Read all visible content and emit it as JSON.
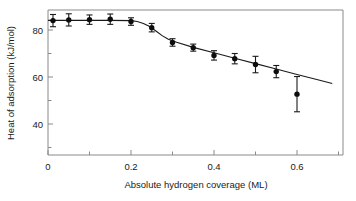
{
  "chart_data": {
    "type": "scatter",
    "title": "",
    "xlabel": "Absolute hydrogen coverage (ML)",
    "ylabel": "Heat of adsorption (kJ/mol)",
    "xlim": [
      0,
      0.71
    ],
    "ylim": [
      31,
      89
    ],
    "grid": false,
    "legend": null,
    "x_ticks": [
      0,
      0.2,
      0.4,
      0.6
    ],
    "x_tick_labels": [
      "0",
      "0.2",
      "0.4",
      "0.6"
    ],
    "x_minor_ticks": [
      0.1,
      0.3,
      0.5,
      0.7
    ],
    "y_ticks": [
      40,
      60,
      80
    ],
    "y_tick_labels": [
      "40",
      "60",
      "80"
    ],
    "y_minor_ticks": [
      50,
      70
    ],
    "marker_style": "filled-circle",
    "error_bar_style": "vertical-capped",
    "series": [
      {
        "name": "Heat of adsorption",
        "x": [
          0.012,
          0.05,
          0.1,
          0.15,
          0.2,
          0.25,
          0.3,
          0.35,
          0.4,
          0.45,
          0.5,
          0.55,
          0.6
        ],
        "y": [
          84.0,
          84.3,
          84.4,
          84.6,
          83.6,
          81.0,
          74.7,
          72.5,
          69.2,
          67.8,
          65.3,
          62.3,
          52.7
        ],
        "yerr": [
          2.6,
          2.6,
          2.0,
          2.2,
          1.6,
          1.8,
          1.6,
          1.5,
          2.0,
          2.2,
          3.5,
          2.6,
          7.5
        ]
      }
    ],
    "fit_curve": {
      "name": "trend-line",
      "x": [
        0.0,
        0.05,
        0.1,
        0.15,
        0.2,
        0.215,
        0.23,
        0.245,
        0.26,
        0.275,
        0.29,
        0.31,
        0.35,
        0.4,
        0.45,
        0.5,
        0.55,
        0.6,
        0.65,
        0.685
      ],
      "y": [
        84.1,
        84.1,
        84.1,
        84.1,
        84.0,
        83.6,
        82.8,
        81.5,
        79.6,
        77.6,
        76.1,
        74.8,
        72.6,
        70.3,
        68.0,
        65.7,
        63.4,
        61.1,
        58.8,
        57.2
      ]
    }
  },
  "axes": {
    "x_title": "Absolute hydrogen coverage (ML)",
    "y_title": "Heat of adsorption (kJ/mol)"
  },
  "colors": {
    "marker": "#0d0d0d",
    "curve": "#1a1a1a",
    "frame": "#8a8a8a",
    "background": "#ffffff",
    "text": "#1a1a1a"
  }
}
